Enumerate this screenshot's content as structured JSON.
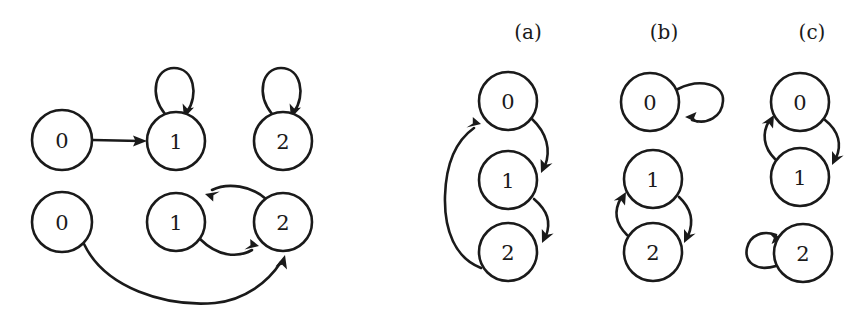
{
  "figure": {
    "background_color": "#ffffff",
    "ink_color": "#1a1a1a",
    "width": 864,
    "height": 316
  },
  "panels": [
    {
      "id": "left-top",
      "caption": "",
      "nodes": [
        {
          "label": "0",
          "cx": 62,
          "cy": 140,
          "r": 30
        },
        {
          "label": "1",
          "cx": 176,
          "cy": 141,
          "r": 29
        },
        {
          "label": "2",
          "cx": 283,
          "cy": 141,
          "r": 29
        }
      ],
      "edges": [
        {
          "from": "0",
          "to": "1",
          "kind": "straight"
        },
        {
          "from": "1",
          "to": "1",
          "kind": "self-loop-top"
        },
        {
          "from": "2",
          "to": "2",
          "kind": "self-loop-top"
        }
      ]
    },
    {
      "id": "left-bottom",
      "caption": "",
      "nodes": [
        {
          "label": "0",
          "cx": 62,
          "cy": 222,
          "r": 30
        },
        {
          "label": "1",
          "cx": 176,
          "cy": 222,
          "r": 29
        },
        {
          "label": "2",
          "cx": 283,
          "cy": 222,
          "r": 29
        }
      ],
      "edges": [
        {
          "from": "1",
          "to": "2",
          "kind": "curve-below"
        },
        {
          "from": "2",
          "to": "1",
          "kind": "curve-above"
        },
        {
          "from": "0",
          "to": "2",
          "kind": "long-arc-below"
        }
      ]
    },
    {
      "id": "a",
      "caption": "(a)",
      "caption_x": 528,
      "caption_y": 32,
      "nodes": [
        {
          "label": "0",
          "cx": 508,
          "cy": 101,
          "r": 29
        },
        {
          "label": "1",
          "cx": 508,
          "cy": 180,
          "r": 29
        },
        {
          "label": "2",
          "cx": 508,
          "cy": 252,
          "r": 29
        }
      ],
      "edges": [
        {
          "from": "0",
          "to": "1",
          "kind": "curve-right"
        },
        {
          "from": "1",
          "to": "2",
          "kind": "curve-right"
        },
        {
          "from": "2",
          "to": "0",
          "kind": "long-curve-left"
        }
      ]
    },
    {
      "id": "b",
      "caption": "(b)",
      "caption_x": 664,
      "caption_y": 32,
      "nodes": [
        {
          "label": "0",
          "cx": 650,
          "cy": 102,
          "r": 29
        },
        {
          "label": "1",
          "cx": 653,
          "cy": 179,
          "r": 29
        },
        {
          "label": "2",
          "cx": 653,
          "cy": 252,
          "r": 29
        }
      ],
      "edges": [
        {
          "from": "0",
          "to": "0",
          "kind": "self-loop-right"
        },
        {
          "from": "1",
          "to": "2",
          "kind": "curve-right"
        },
        {
          "from": "2",
          "to": "1",
          "kind": "curve-left"
        }
      ]
    },
    {
      "id": "c",
      "caption": "(c)",
      "caption_x": 812,
      "caption_y": 32,
      "nodes": [
        {
          "label": "0",
          "cx": 800,
          "cy": 102,
          "r": 29
        },
        {
          "label": "1",
          "cx": 800,
          "cy": 177,
          "r": 29
        },
        {
          "label": "2",
          "cx": 803,
          "cy": 253,
          "r": 29
        }
      ],
      "edges": [
        {
          "from": "0",
          "to": "1",
          "kind": "curve-right"
        },
        {
          "from": "1",
          "to": "0",
          "kind": "curve-left"
        },
        {
          "from": "2",
          "to": "2",
          "kind": "self-loop-left"
        }
      ]
    }
  ]
}
